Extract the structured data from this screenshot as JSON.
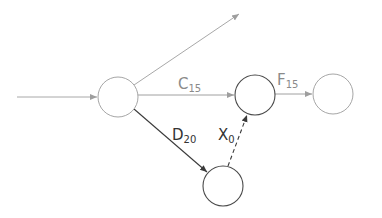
{
  "diagram": {
    "type": "network-activity-diagram",
    "colors": {
      "light": "#9e9e9e",
      "dark": "#4a4a4a",
      "label_light": "#8a8a8a",
      "label_dark": "#333333"
    },
    "nodes": [
      {
        "id": "A",
        "cx": 118,
        "cy": 97,
        "r": 20,
        "tone": "light"
      },
      {
        "id": "B",
        "cx": 255,
        "cy": 95,
        "r": 20,
        "tone": "dark"
      },
      {
        "id": "C",
        "cx": 333,
        "cy": 94,
        "r": 20,
        "tone": "light"
      },
      {
        "id": "D",
        "cx": 223,
        "cy": 186,
        "r": 20,
        "tone": "dark"
      }
    ],
    "edges": [
      {
        "id": "in",
        "from": "start",
        "to": "A",
        "label": "",
        "sub": "",
        "style": "solid",
        "tone": "light"
      },
      {
        "id": "up",
        "from": "A",
        "to": "out",
        "label": "",
        "sub": "",
        "style": "solid",
        "tone": "light"
      },
      {
        "id": "C15",
        "from": "A",
        "to": "B",
        "label": "C",
        "sub": "15",
        "style": "solid",
        "tone": "light"
      },
      {
        "id": "F15",
        "from": "B",
        "to": "C",
        "label": "F",
        "sub": "15",
        "style": "solid",
        "tone": "light"
      },
      {
        "id": "D20",
        "from": "A",
        "to": "D",
        "label": "D",
        "sub": "20",
        "style": "solid",
        "tone": "dark"
      },
      {
        "id": "X0",
        "from": "D",
        "to": "B",
        "label": "X",
        "sub": "0",
        "style": "dashed",
        "tone": "dark"
      }
    ],
    "labels": {
      "c": {
        "main": "C",
        "sub": "15"
      },
      "f": {
        "main": "F",
        "sub": "15"
      },
      "d": {
        "main": "D",
        "sub": "20"
      },
      "x": {
        "main": "X",
        "sub": "0"
      }
    }
  }
}
